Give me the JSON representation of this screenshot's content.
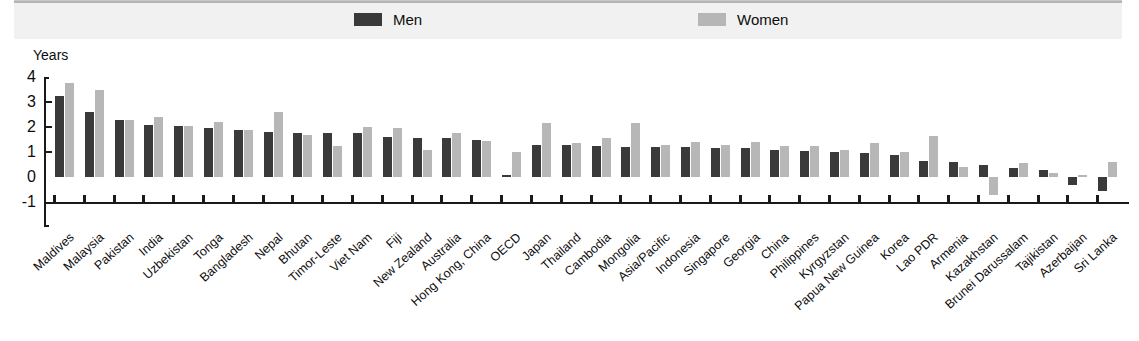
{
  "legend": {
    "items": [
      {
        "label": "Men",
        "color": "#3a3a3a",
        "icon": "legend-swatch-men"
      },
      {
        "label": "Women",
        "color": "#b7b7b7",
        "icon": "legend-swatch-women"
      }
    ]
  },
  "axis": {
    "y_title": "Years",
    "y_ticks": [
      "4",
      "3",
      "2",
      "1",
      "0",
      "-1"
    ]
  },
  "chart_data": {
    "type": "bar",
    "title": "",
    "subtitle": "",
    "xlabel": "",
    "ylabel": "Years",
    "ylim": [
      -1,
      4
    ],
    "yticks": [
      -1,
      0,
      1,
      2,
      3,
      4
    ],
    "grid": false,
    "legend_position": "top",
    "categories": [
      "Maldives",
      "Malaysia",
      "Pakistan",
      "India",
      "Uzbekistan",
      "Tonga",
      "Bangladesh",
      "Nepal",
      "Bhutan",
      "Timor-Leste",
      "Viet Nam",
      "Fiji",
      "New Zealand",
      "Australia",
      "Hong Kong, China",
      "OECD",
      "Japan",
      "Thailand",
      "Cambodia",
      "Mongolia",
      "Asia/Pacific",
      "Indonesia",
      "Singapore",
      "Georgia",
      "China",
      "Philippines",
      "Kyrgyzstan",
      "Papua New Guinea",
      "Korea",
      "Lao PDR",
      "Armenia",
      "Kazakhstan",
      "Brunei Darussalam",
      "Tajikistan",
      "Azerbaijan",
      "Sri Lanka"
    ],
    "series": [
      {
        "name": "Men",
        "color": "#3a3a3a",
        "values": [
          3.25,
          2.6,
          2.3,
          2.1,
          2.05,
          1.95,
          1.9,
          1.8,
          1.75,
          1.75,
          1.75,
          1.6,
          1.55,
          1.55,
          1.5,
          0.1,
          1.3,
          1.3,
          1.25,
          1.2,
          1.2,
          1.2,
          1.15,
          1.15,
          1.1,
          1.05,
          1.0,
          0.95,
          0.9,
          0.65,
          0.6,
          0.5,
          0.35,
          0.3,
          -0.3,
          -0.55
        ]
      },
      {
        "name": "Women",
        "color": "#b7b7b7",
        "values": [
          3.75,
          3.5,
          2.3,
          2.4,
          2.05,
          2.2,
          1.9,
          2.6,
          1.7,
          1.25,
          2.0,
          1.95,
          1.1,
          1.75,
          1.45,
          1.0,
          2.15,
          1.35,
          1.55,
          2.15,
          1.3,
          1.4,
          1.3,
          1.4,
          1.25,
          1.25,
          1.1,
          1.35,
          1.0,
          1.65,
          0.4,
          -0.7,
          0.55,
          0.15,
          0.1,
          0.6
        ]
      }
    ]
  }
}
